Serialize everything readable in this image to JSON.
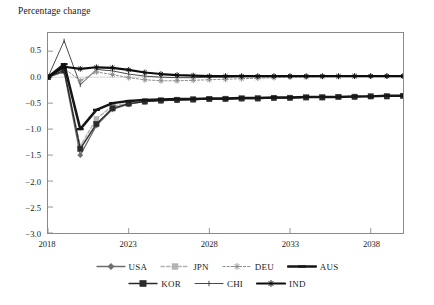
{
  "chart_data": {
    "type": "line",
    "title": "Percentage change",
    "xlabel": "",
    "ylabel": "",
    "xlim": [
      2018,
      2040
    ],
    "ylim": [
      -3.0,
      0.85
    ],
    "grid": false,
    "legend_position": "bottom",
    "y_ticks": [
      "0.5",
      "0.0",
      "−0.5",
      "−1.0",
      "−1.5",
      "−2.0",
      "−2.5",
      "−3.0"
    ],
    "y_tick_values": [
      0.5,
      0.0,
      -0.5,
      -1.0,
      -1.5,
      -2.0,
      -2.5,
      -3.0
    ],
    "x_ticks": [
      "2018",
      "2023",
      "2028",
      "2033",
      "2038"
    ],
    "x_tick_values": [
      2018,
      2023,
      2028,
      2033,
      2038
    ],
    "x": [
      2018,
      2019,
      2020,
      2021,
      2022,
      2023,
      2024,
      2025,
      2026,
      2027,
      2028,
      2029,
      2030,
      2031,
      2032,
      2033,
      2034,
      2035,
      2036,
      2037,
      2038,
      2039,
      2040
    ],
    "series": [
      {
        "name": "USA",
        "color": "#6e6e6e",
        "values": [
          0.0,
          0.1,
          -1.5,
          -0.93,
          -0.62,
          -0.52,
          -0.47,
          -0.45,
          -0.44,
          -0.43,
          -0.42,
          -0.42,
          -0.41,
          -0.41,
          -0.4,
          -0.4,
          -0.39,
          -0.39,
          -0.38,
          -0.38,
          -0.37,
          -0.37,
          -0.36
        ]
      },
      {
        "name": "JPN",
        "color": "#b4b4b4",
        "values": [
          0.0,
          0.14,
          -1.33,
          -0.8,
          -0.56,
          -0.5,
          -0.46,
          -0.44,
          -0.43,
          -0.42,
          -0.42,
          -0.41,
          -0.41,
          -0.4,
          -0.4,
          -0.39,
          -0.39,
          -0.38,
          -0.38,
          -0.37,
          -0.37,
          -0.36,
          -0.36
        ]
      },
      {
        "name": "DEU",
        "color": "#8c8c8c",
        "values": [
          0.0,
          0.17,
          -0.07,
          0.1,
          0.05,
          -0.01,
          -0.05,
          -0.07,
          -0.07,
          -0.06,
          -0.05,
          -0.04,
          -0.03,
          -0.02,
          -0.01,
          0.0,
          0.0,
          0.01,
          0.01,
          0.02,
          0.02,
          0.02,
          0.02
        ]
      },
      {
        "name": "AUS",
        "color": "#161616",
        "values": [
          0.0,
          0.25,
          -1.0,
          -0.63,
          -0.5,
          -0.46,
          -0.44,
          -0.43,
          -0.42,
          -0.42,
          -0.41,
          -0.41,
          -0.4,
          -0.4,
          -0.39,
          -0.39,
          -0.38,
          -0.38,
          -0.38,
          -0.37,
          -0.37,
          -0.36,
          -0.36
        ]
      },
      {
        "name": "KOR",
        "color": "#2b2b2b",
        "values": [
          0.0,
          0.13,
          -1.38,
          -0.9,
          -0.6,
          -0.51,
          -0.47,
          -0.45,
          -0.44,
          -0.43,
          -0.42,
          -0.42,
          -0.41,
          -0.41,
          -0.4,
          -0.4,
          -0.39,
          -0.39,
          -0.38,
          -0.38,
          -0.37,
          -0.37,
          -0.36
        ]
      },
      {
        "name": "CHI",
        "color": "#333333",
        "values": [
          0.0,
          0.7,
          -0.15,
          0.15,
          0.12,
          0.06,
          0.02,
          0.0,
          -0.01,
          -0.01,
          0.0,
          0.0,
          0.01,
          0.01,
          0.01,
          0.02,
          0.02,
          0.02,
          0.02,
          0.02,
          0.02,
          0.02,
          0.02
        ]
      },
      {
        "name": "IND",
        "color": "#0d0d0d",
        "values": [
          0.0,
          0.2,
          0.16,
          0.19,
          0.18,
          0.14,
          0.09,
          0.06,
          0.04,
          0.03,
          0.02,
          0.02,
          0.02,
          0.02,
          0.02,
          0.02,
          0.02,
          0.02,
          0.02,
          0.02,
          0.02,
          0.02,
          0.02
        ]
      }
    ],
    "legend_rows": [
      [
        "USA",
        "JPN",
        "DEU",
        "AUS"
      ],
      [
        "KOR",
        "CHI",
        "IND"
      ]
    ]
  }
}
